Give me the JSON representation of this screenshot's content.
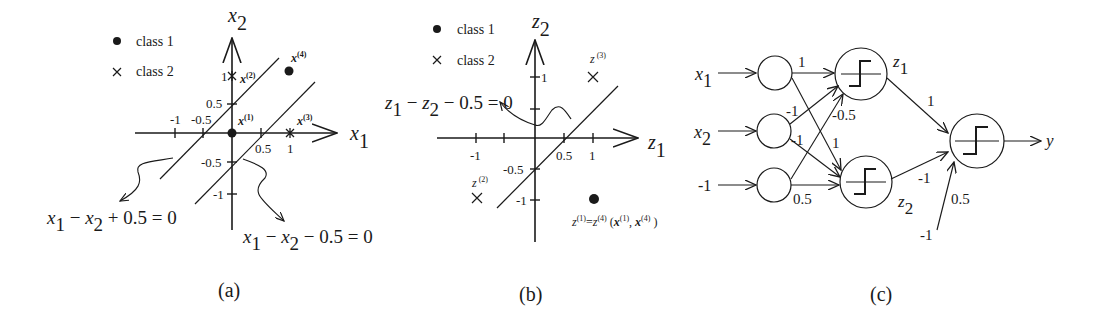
{
  "panels": {
    "a": {
      "caption": "(a)",
      "legend": {
        "class1": "class 1",
        "class2": "class 2"
      },
      "axis_x": "x",
      "axis_x_sub": "1",
      "axis_y": "x",
      "axis_y_sub": "2",
      "ticks_x": [
        "-1",
        "-0.5",
        "0.5",
        "1"
      ],
      "ticks_y": [
        "1",
        "0.5",
        "-0.5",
        "-1"
      ],
      "points": [
        {
          "label": "x",
          "sup": "(1)",
          "x": 0,
          "y": 0,
          "class": "class 1"
        },
        {
          "label": "x",
          "sup": "(2)",
          "x": 0,
          "y": 1,
          "class": "class 2"
        },
        {
          "label": "x",
          "sup": "(3)",
          "x": 1,
          "y": 0,
          "class": "class 2"
        },
        {
          "label": "x",
          "sup": "(4)",
          "x": 1,
          "y": 1,
          "class": "class 1"
        }
      ],
      "eq_left": {
        "a": "x",
        "a_sub": "1",
        "op1": " − ",
        "b": "x",
        "b_sub": "2",
        "rest": " + 0.5  =  0"
      },
      "eq_right": {
        "a": "x",
        "a_sub": "1",
        "op1": " − ",
        "b": "x",
        "b_sub": "2",
        "rest": " − 0.5  =  0"
      }
    },
    "b": {
      "caption": "(b)",
      "legend": {
        "class1": "class 1",
        "class2": "class 2"
      },
      "axis_x": "z",
      "axis_x_sub": "1",
      "axis_y": "z",
      "axis_y_sub": "2",
      "ticks_x": [
        "-1",
        "0.5",
        "1"
      ],
      "ticks_y": [
        "1",
        "-0.5",
        "-1"
      ],
      "points": [
        {
          "label": "z",
          "sup": "(2)",
          "x": -1,
          "y": -1,
          "class": "class 2"
        },
        {
          "label": "z",
          "sup": "(3)",
          "x": 1,
          "y": 1,
          "class": "class 2"
        },
        {
          "label": "z(1)=z(4)",
          "x": 1,
          "y": -1,
          "class": "class 1"
        }
      ],
      "eq": {
        "a": "z",
        "a_sub": "1",
        "op1": " − ",
        "b": "z",
        "b_sub": "2",
        "rest": " − 0.5  =  0"
      },
      "merged_label": {
        "z1": "z",
        "sup1": "(1)",
        "eq": "=",
        "z4": "z",
        "sup4": "(4)",
        "open": "  (",
        "x1": "x",
        "xsup1": "(1)",
        "comma": ", ",
        "x4": "x",
        "xsup4": "(4)",
        "close": " )"
      }
    },
    "c": {
      "caption": "(c)",
      "inputs": [
        {
          "label": "x",
          "sub": "1"
        },
        {
          "label": "x",
          "sub": "2"
        },
        {
          "label": "-1",
          "sub": ""
        }
      ],
      "hidden": [
        {
          "label": "z",
          "sub": "1"
        },
        {
          "label": "z",
          "sub": "2"
        }
      ],
      "output": "y",
      "weights_to_z1": {
        "x1": "1",
        "x2": "-1",
        "bias": "-0.5"
      },
      "weights_to_z2": {
        "x1": "1",
        "x2": "-1",
        "bias": "0.5"
      },
      "weights_to_y": {
        "z1": "1",
        "z2": "-1",
        "bias": "0.5"
      },
      "output_bias_input": "-1"
    }
  }
}
